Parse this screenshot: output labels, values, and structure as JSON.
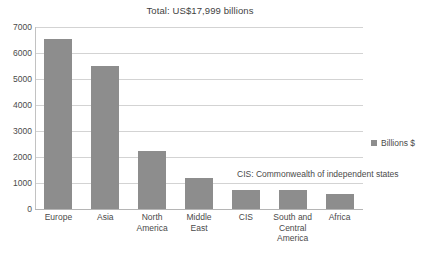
{
  "chart_data": {
    "type": "bar",
    "title": "Total: US$17,999 billions",
    "xlabel": "",
    "ylabel": "",
    "ylim": [
      0,
      7000
    ],
    "ytick_step": 1000,
    "grid": true,
    "legend_position": "right",
    "bar_color": "#8d8d8d",
    "categories": [
      "Europe",
      "Asia",
      "North America",
      "Middle East",
      "CIS",
      "South and Central America",
      "Africa"
    ],
    "category_lines": [
      [
        "Europe"
      ],
      [
        "Asia"
      ],
      [
        "North",
        "America"
      ],
      [
        "Middle",
        "East"
      ],
      [
        "CIS"
      ],
      [
        "South and",
        "Central",
        "America"
      ],
      [
        "Africa"
      ]
    ],
    "values": [
      6550,
      5500,
      2250,
      1200,
      750,
      720,
      560
    ],
    "series": [
      {
        "name": "Billions $",
        "values": [
          6550,
          5500,
          2250,
          1200,
          750,
          720,
          560
        ]
      }
    ],
    "ytick_labels": [
      "7000",
      "6000",
      "5000",
      "4000",
      "3000",
      "2000",
      "1000",
      "0"
    ],
    "ytick_values": [
      7000,
      6000,
      5000,
      4000,
      3000,
      2000,
      1000,
      0
    ],
    "legend": [
      "Billions $"
    ],
    "annotations": [
      "CIS: Commonwealth of independent states"
    ]
  },
  "legend": {
    "label": "Billions $"
  },
  "annotation": {
    "text": "CIS: Commonwealth of independent states"
  }
}
